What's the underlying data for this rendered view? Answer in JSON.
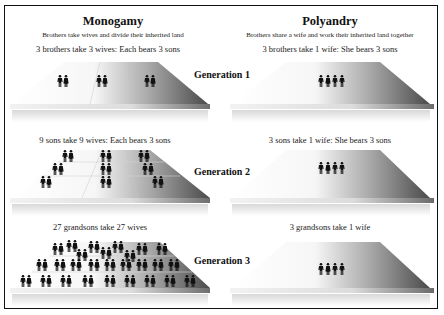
{
  "columns": [
    {
      "title": "Monogamy",
      "subtitle": "Brothers take wives and divide their inherited land",
      "generations": [
        {
          "caption": "3 brothers take 3 wives: Each bears 3 sons",
          "couples": 3
        },
        {
          "caption": "9 sons take 9 wives: Each bears 3 sons",
          "couples": 9
        },
        {
          "caption": "27 grandsons take 27 wives",
          "couples": 27
        }
      ]
    },
    {
      "title": "Polyandry",
      "subtitle": "Brothers share a wife and work their inherited land together",
      "generations": [
        {
          "caption": "3 brothers take 1 wife: She bears 3 sons",
          "people": 4
        },
        {
          "caption": "3 sons take 1 wife: She bears 3 sons",
          "people": 4
        },
        {
          "caption": "3 grandsons take 1 wife",
          "people": 4
        }
      ]
    }
  ],
  "generation_labels": [
    "Generation 1",
    "Generation 2",
    "Generation 3"
  ],
  "icons": {
    "man": "man-icon",
    "woman": "woman-icon"
  },
  "colors": {
    "figure": "#111111",
    "land_light": "#ffffff",
    "land_dark": "#5a5a5a",
    "border": "#111111"
  }
}
